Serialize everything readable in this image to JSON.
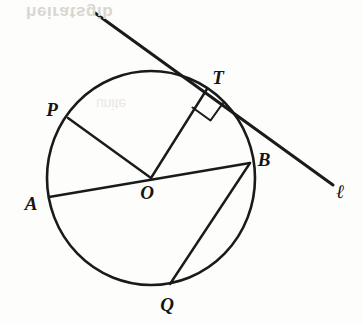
{
  "figure": {
    "background_color": "#fdfdfc",
    "ink_color": "#1a1a1a",
    "watermark_text": "heiratsgib",
    "watermark_text_secondary": "unite",
    "circle": {
      "center_label": "O",
      "center_x": 151,
      "center_y": 178,
      "radius": 104
    },
    "points": [
      {
        "name": "P",
        "label": "P",
        "x": 68,
        "y": 118,
        "label_x": 52,
        "label_y": 116
      },
      {
        "name": "A",
        "label": "A",
        "x": 49,
        "y": 197,
        "label_x": 31,
        "label_y": 210
      },
      {
        "name": "O",
        "label": "O",
        "x": 151,
        "y": 178,
        "label_x": 146,
        "label_y": 199
      },
      {
        "name": "B",
        "label": "B",
        "x": 250,
        "y": 163,
        "label_x": 262,
        "label_y": 165
      },
      {
        "name": "T",
        "label": "T",
        "x": 207,
        "y": 88,
        "label_x": 215,
        "label_y": 83
      },
      {
        "name": "Q",
        "label": "Q",
        "x": 170,
        "y": 284,
        "label_x": 162,
        "label_y": 310
      }
    ],
    "segments": [
      {
        "name": "diameter-AB",
        "from": "A",
        "to": "B"
      },
      {
        "name": "radius-OP",
        "from": "O",
        "to": "P"
      },
      {
        "name": "radius-OT",
        "from": "O",
        "to": "T"
      },
      {
        "name": "chord-BQ",
        "from": "B",
        "to": "Q"
      }
    ],
    "tangent_line": {
      "label": "ℓ",
      "label_x": 338,
      "label_y": 196,
      "x1": 95,
      "y1": 13,
      "x2": 333,
      "y2": 185,
      "touches_point": "T"
    },
    "right_angle": {
      "at_point": "T",
      "between": [
        "radius-OT",
        "tangent-line-ℓ"
      ],
      "marker": "square"
    }
  }
}
